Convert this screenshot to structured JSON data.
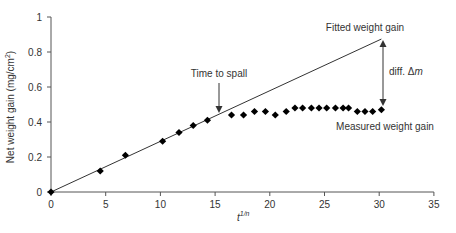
{
  "chart_data": {
    "type": "scatter",
    "title": "",
    "xlabel": "t^{1/n}",
    "xlabel_base": "t",
    "xlabel_sup": "1/n",
    "ylabel": "Net weight gain (mg/cm²)",
    "ylabel_main": "Net weight gain (mg/cm",
    "ylabel_sup": "2",
    "ylabel_end": ")",
    "xlim": [
      0,
      35
    ],
    "ylim": [
      0,
      1
    ],
    "xticks": [
      0,
      5,
      10,
      15,
      20,
      25,
      30,
      35
    ],
    "yticks": [
      0,
      0.2,
      0.4,
      0.6,
      0.8,
      1
    ],
    "ytick_labels": [
      "0",
      "0.2",
      "0.4",
      "0.6",
      "0.8",
      "1"
    ],
    "grid": false,
    "series": [
      {
        "name": "Measured weight gain",
        "kind": "scatter",
        "marker": "diamond",
        "color": "#000000",
        "x": [
          0,
          4.5,
          6.8,
          10.2,
          11.7,
          13.0,
          14.3,
          16.5,
          17.6,
          18.6,
          19.6,
          20.5,
          21.5,
          22.3,
          23.0,
          23.8,
          24.5,
          25.2,
          26.0,
          26.7,
          27.2,
          28.0,
          28.7,
          29.4,
          30.2
        ],
        "y": [
          0,
          0.12,
          0.21,
          0.29,
          0.34,
          0.38,
          0.41,
          0.44,
          0.44,
          0.46,
          0.46,
          0.44,
          0.46,
          0.48,
          0.48,
          0.48,
          0.48,
          0.48,
          0.48,
          0.48,
          0.48,
          0.46,
          0.46,
          0.46,
          0.47
        ]
      },
      {
        "name": "Fitted weight gain",
        "kind": "line",
        "color": "#333333",
        "x": [
          0,
          30.2
        ],
        "y": [
          0,
          0.874
        ]
      }
    ],
    "annotations": [
      {
        "text": "Fitted weight gain",
        "x": 30.5,
        "y": 0.93
      },
      {
        "text": "Time to spall",
        "x": 15.3,
        "y": 0.68,
        "arrow_to": [
          15.3,
          0.46
        ]
      },
      {
        "text": "diff. Δm",
        "x": 30.9,
        "y": 0.69,
        "double_arrow": [
          [
            30.4,
            0.87
          ],
          [
            30.4,
            0.49
          ]
        ]
      },
      {
        "text": "Measured weight gain",
        "x": 30.5,
        "y": 0.36
      }
    ]
  },
  "labels": {
    "fitted": "Fitted weight gain",
    "spall": "Time to spall",
    "diff_prefix": "diff. ",
    "diff_delta": "Δ",
    "diff_m": "m",
    "measured": "Measured weight gain"
  }
}
